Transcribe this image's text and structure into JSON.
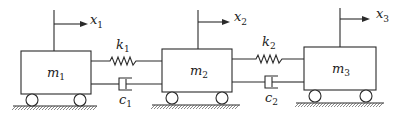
{
  "diagram": {
    "masses": [
      {
        "label": "m",
        "sub": "1",
        "displacement": "x",
        "disp_sub": "1"
      },
      {
        "label": "m",
        "sub": "2",
        "displacement": "x",
        "disp_sub": "2"
      },
      {
        "label": "m",
        "sub": "3",
        "displacement": "x",
        "disp_sub": "3"
      }
    ],
    "springs": [
      {
        "label": "k",
        "sub": "1",
        "connects": "m1-m2"
      },
      {
        "label": "k",
        "sub": "2",
        "connects": "m2-m3"
      }
    ],
    "dampers": [
      {
        "label": "c",
        "sub": "1",
        "connects": "m1-m2"
      },
      {
        "label": "c",
        "sub": "2",
        "connects": "m2-m3"
      }
    ],
    "colors": {
      "line": "#2a2a2a",
      "background": "#ffffff"
    }
  }
}
